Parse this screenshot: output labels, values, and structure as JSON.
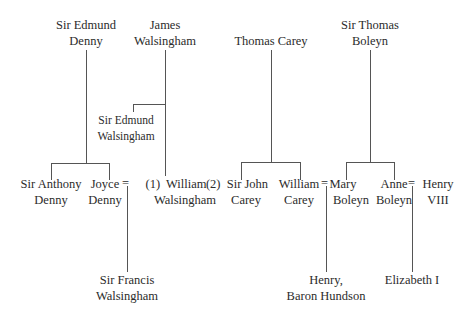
{
  "diagram": {
    "type": "family-tree",
    "generation1": [
      {
        "id": "edmund-denny",
        "lines": [
          "Sir Edmund",
          "Denny"
        ]
      },
      {
        "id": "james-walsingham",
        "lines": [
          "James",
          "Walsingham"
        ]
      },
      {
        "id": "thomas-carey",
        "lines": [
          "Thomas Carey"
        ]
      },
      {
        "id": "thomas-boleyn",
        "lines": [
          "Sir Thomas",
          "Boleyn"
        ]
      }
    ],
    "edmund_walsingham": {
      "lines": [
        "Sir Edmund",
        "Walsingham"
      ]
    },
    "generation2": [
      {
        "id": "anthony-denny",
        "lines": [
          "Sir Anthony",
          "Denny"
        ]
      },
      {
        "id": "joyce-denny",
        "lines": [
          "Joyce",
          "Denny"
        ]
      },
      {
        "id": "william-walsingham",
        "lines": [
          "(1)  William",
          "Walsingham"
        ]
      },
      {
        "id": "john-carey",
        "lines": [
          "(2)  Sir John",
          "Carey"
        ]
      },
      {
        "id": "william-carey",
        "lines": [
          "William",
          "Carey"
        ]
      },
      {
        "id": "mary-boleyn",
        "lines": [
          "Mary",
          "Boleyn"
        ]
      },
      {
        "id": "anne-boleyn",
        "lines": [
          "Anne",
          "Boleyn"
        ]
      },
      {
        "id": "henry-viii",
        "lines": [
          "Henry",
          "VIII"
        ]
      }
    ],
    "marriage_symbol": "=",
    "generation3": [
      {
        "id": "francis-walsingham",
        "lines": [
          "Sir Francis",
          "Walsingham"
        ]
      },
      {
        "id": "henry-hundson",
        "lines": [
          "Henry,",
          "Baron Hundson"
        ]
      },
      {
        "id": "elizabeth-i",
        "lines": [
          "Elizabeth I"
        ]
      }
    ],
    "line_color": "#555555",
    "text_color": "#2b2b2b"
  }
}
